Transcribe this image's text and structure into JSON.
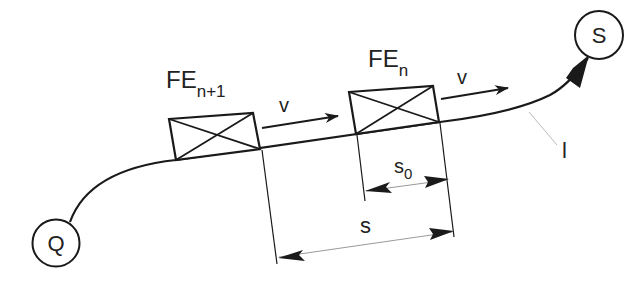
{
  "diagram": {
    "nodes": {
      "source": {
        "label": "Q"
      },
      "sink": {
        "label": "S"
      }
    },
    "units": {
      "follower": {
        "base": "FE",
        "sub": "n+1"
      },
      "leader": {
        "base": "FE",
        "sub": "n"
      }
    },
    "velocity": {
      "follower_label": "v",
      "leader_label": "v"
    },
    "dimensions": {
      "min_gap": {
        "base": "s",
        "sub": "0"
      },
      "spacing": {
        "label": "s"
      }
    },
    "track_label": "l",
    "colors": {
      "stroke": "#1a1a1a",
      "leader_line": "#bbbbbb",
      "background": "#ffffff"
    }
  }
}
